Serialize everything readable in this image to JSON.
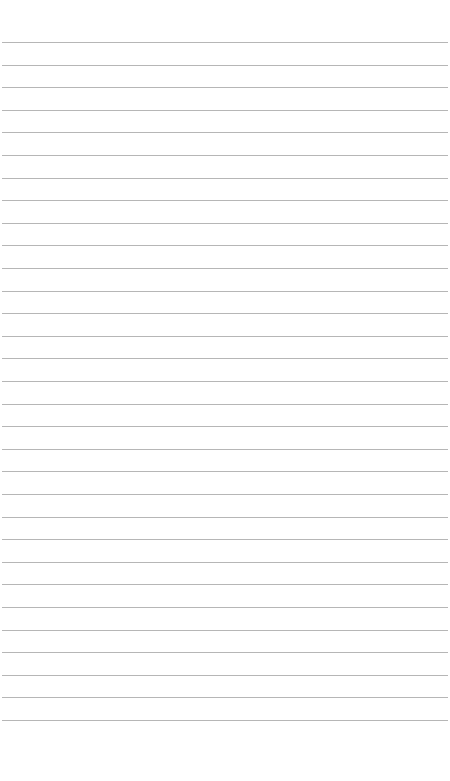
{
  "page": {
    "type": "blank lined paper",
    "background_color": "#ffffff",
    "line_color": "#a9a9a9",
    "line_count": 31,
    "first_line_y": 42,
    "line_spacing": 22.6
  }
}
